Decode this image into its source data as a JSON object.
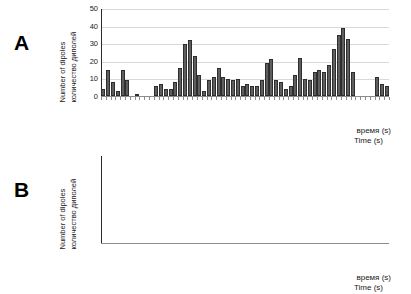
{
  "figure": {
    "panels": [
      {
        "letter": "A",
        "axis": {
          "ylabel_en": "Number of dipoles",
          "ylabel_ru": "количество диполей",
          "xlabel_ru": "время (s)",
          "xlabel_en": "Time (s)",
          "yticks": [
            0,
            10,
            20,
            30,
            40,
            50
          ],
          "ylim": [
            0,
            50
          ],
          "xticks": [
            "-1,0",
            "-0,5",
            "0,1",
            "0,6",
            "1,1",
            "1,6",
            "2,1",
            "2,6",
            "3,1",
            "3,6",
            "4,1",
            "4,6"
          ]
        }
      },
      {
        "letter": "B",
        "axis": {
          "ylabel_en": "Number of dipoles",
          "ylabel_ru": "количество диполей",
          "xlabel_ru": "время (s)",
          "xlabel_en": "Time (s)",
          "yticks": [
            0,
            10,
            20,
            30,
            40,
            50
          ],
          "ylim": [
            0,
            50
          ],
          "xticks": [
            "-1,0",
            "-0,5",
            "0,1",
            "0,6",
            "1,1",
            "1,6",
            "2,1",
            "2,6",
            "3,1",
            "3,6",
            "4,1",
            "4,6"
          ]
        }
      }
    ],
    "colors": {
      "bar_fill": "#5e5e5e",
      "bar_stroke": "#2e2e2e",
      "gridline": "#d9d9d9",
      "axis": "#2b2b2b",
      "text": "#1a1a1a"
    }
  },
  "chart_data": [
    {
      "type": "bar",
      "panel": "A",
      "title": "",
      "xlabel": "время (s) / Time (s)",
      "ylabel": "Number of dipoles / количество диполей",
      "ylim": [
        0,
        50
      ],
      "yticks": [
        0,
        10,
        20,
        30,
        40,
        50
      ],
      "grid": true,
      "legend": "none",
      "bin_width": 0.1,
      "x_start": -1.05,
      "categories": [
        "-1,0",
        "-0,5",
        "0,1",
        "0,6",
        "1,1",
        "1,6",
        "2,1",
        "2,6",
        "3,1",
        "3,6",
        "4,1",
        "4,6"
      ],
      "x": [
        -1.0,
        -0.9,
        -0.8,
        -0.7,
        -0.6,
        -0.5,
        -0.4,
        -0.3,
        -0.2,
        -0.1,
        0.0,
        0.1,
        0.2,
        0.3,
        0.4,
        0.5,
        0.6,
        0.7,
        0.8,
        0.9,
        1.0,
        1.1,
        1.2,
        1.3,
        1.4,
        1.5,
        1.6,
        1.7,
        1.8,
        1.9,
        2.0,
        2.1,
        2.2,
        2.3,
        2.4,
        2.5,
        2.6,
        2.7,
        2.8,
        2.9,
        3.0,
        3.1,
        3.2,
        3.3,
        3.4,
        3.5,
        3.6,
        3.7,
        3.8,
        3.9,
        4.0,
        4.1,
        4.2,
        4.3,
        4.4,
        4.5,
        4.6,
        4.7,
        4.8,
        4.9
      ],
      "values": [
        4,
        15,
        8,
        3,
        15,
        9,
        0,
        1,
        0,
        0,
        0,
        6,
        7,
        4,
        4,
        8,
        16,
        30,
        32,
        23,
        12,
        3,
        9,
        11,
        16,
        11,
        10,
        9,
        10,
        6,
        7,
        6,
        6,
        9,
        19,
        21,
        9,
        8,
        4,
        6,
        12,
        22,
        10,
        9,
        14,
        15,
        14,
        18,
        27,
        35,
        39,
        33,
        14,
        0,
        0,
        0,
        0,
        11,
        7,
        6
      ]
    },
    {
      "type": "bar",
      "panel": "B",
      "title": "",
      "xlabel": "время (s) / Time (s)",
      "ylabel": "Number of dipoles / количество диполей",
      "ylim": [
        0,
        50
      ],
      "yticks": [
        0,
        10,
        20,
        30,
        40,
        50
      ],
      "grid": true,
      "legend": "none",
      "bin_width": 0.1,
      "x_start": -1.05,
      "categories": [
        "-1,0",
        "-0,5",
        "0,1",
        "0,6",
        "1,1",
        "1,6",
        "2,1",
        "2,6",
        "3,1",
        "3,6",
        "4,1",
        "4,6"
      ],
      "x": [
        -1.0,
        -0.9,
        -0.8,
        -0.7,
        -0.6,
        -0.5,
        -0.4,
        -0.3,
        -0.2,
        -0.1,
        0.0,
        0.1,
        0.2,
        0.3,
        0.4,
        0.5,
        0.6,
        0.7,
        0.8,
        0.9,
        1.0,
        1.1,
        1.2,
        1.3,
        1.4,
        1.5,
        1.6,
        1.7,
        1.8,
        1.9,
        2.0,
        2.1,
        2.2,
        2.3,
        2.4,
        2.5,
        2.6,
        2.7,
        2.8,
        2.9,
        3.0,
        3.1,
        3.2,
        3.3,
        3.4,
        3.5,
        3.6,
        3.7,
        3.8,
        3.9,
        4.0,
        4.1,
        4.2,
        4.3,
        4.4,
        4.5,
        4.6,
        4.7,
        4.8,
        4.9
      ],
      "values": [
        11,
        21,
        3,
        1,
        2,
        3,
        0,
        0,
        0,
        0,
        0,
        0,
        0,
        0,
        11,
        31,
        37,
        40,
        29,
        13,
        0,
        3,
        1,
        0,
        4,
        4,
        1,
        8,
        8,
        0,
        0,
        0,
        6,
        11,
        7,
        0,
        0,
        0,
        1,
        0,
        0,
        1,
        20,
        36,
        33,
        11,
        0,
        0,
        0,
        0,
        0,
        4,
        15,
        20,
        10,
        3,
        9,
        6,
        0,
        0
      ]
    }
  ]
}
